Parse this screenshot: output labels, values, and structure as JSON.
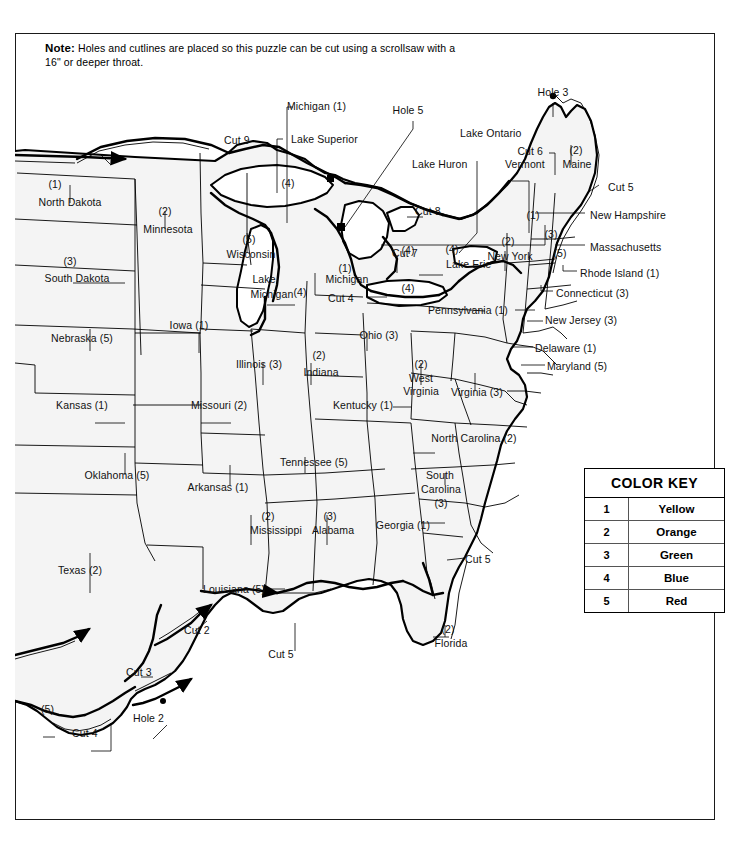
{
  "note": {
    "bold": "Note:",
    "text": " Holes and cutlines are placed so this puzzle can be cut using a scrollsaw with a 16\" or deeper throat."
  },
  "color_key": {
    "title": "COLOR KEY",
    "rows": [
      {
        "number": "1",
        "color": "Yellow"
      },
      {
        "number": "2",
        "color": "Orange"
      },
      {
        "number": "3",
        "color": "Green"
      },
      {
        "number": "4",
        "color": "Blue"
      },
      {
        "number": "5",
        "color": "Red"
      }
    ]
  },
  "states": [
    {
      "name": "North Dakota",
      "number": "(1)"
    },
    {
      "name": "Minnesota",
      "number": "(2)"
    },
    {
      "name": "South Dakota",
      "number": "(3)"
    },
    {
      "name": "Wisconsin",
      "number": "(5)"
    },
    {
      "name": "Iowa",
      "number": "(1)"
    },
    {
      "name": "Nebraska",
      "number": "(5)"
    },
    {
      "name": "Kansas",
      "number": "(1)"
    },
    {
      "name": "Missouri",
      "number": "(2)"
    },
    {
      "name": "Illinois",
      "number": "(3)"
    },
    {
      "name": "Indiana",
      "number": "(2)"
    },
    {
      "name": "Michigan",
      "number": "(1)"
    },
    {
      "name": "Michigan",
      "number": "(4)"
    },
    {
      "name": "Ohio",
      "number": "(3)"
    },
    {
      "name": "Oklahoma",
      "number": "(5)"
    },
    {
      "name": "Arkansas",
      "number": "(1)"
    },
    {
      "name": "Texas",
      "number": "(2)"
    },
    {
      "name": "Louisiana",
      "number": "(5)"
    },
    {
      "name": "Mississippi",
      "number": "(2)"
    },
    {
      "name": "Alabama",
      "number": "(3)"
    },
    {
      "name": "Tennessee",
      "number": "(5)"
    },
    {
      "name": "Kentucky",
      "number": "(1)"
    },
    {
      "name": "West Virginia",
      "number": "(2)"
    },
    {
      "name": "Virginia",
      "number": "(3)"
    },
    {
      "name": "North Carolina",
      "number": "(2)"
    },
    {
      "name": "South Carolina",
      "number": "(3)"
    },
    {
      "name": "Georgia",
      "number": "(1)"
    },
    {
      "name": "Florida",
      "number": "(2)"
    },
    {
      "name": "Pennsylvania",
      "number": "(1)"
    },
    {
      "name": "New York",
      "number": "(2)"
    },
    {
      "name": "Vermont",
      "number": "(3)"
    },
    {
      "name": "Maine",
      "number": "(2)"
    },
    {
      "name": "New Hampshire",
      "number": "(1)"
    },
    {
      "name": "Massachusetts",
      "number": "(5)"
    },
    {
      "name": "Rhode Island",
      "number": "(1)"
    },
    {
      "name": "Connecticut",
      "number": "(3)"
    },
    {
      "name": "New Jersey",
      "number": "(3)"
    },
    {
      "name": "Delaware",
      "number": "(1)"
    },
    {
      "name": "Maryland",
      "number": "(5)"
    }
  ],
  "lakes": [
    {
      "name": "Lake Superior"
    },
    {
      "name": "Lake Huron"
    },
    {
      "name": "Lake Michigan",
      "number": "(4)"
    },
    {
      "name": "Lake Erie"
    },
    {
      "name": "Lake Ontario"
    }
  ],
  "cuts": [
    {
      "label": "Cut 2"
    },
    {
      "label": "Cut 3"
    },
    {
      "label": "Cut 4"
    },
    {
      "label": "Cut 5"
    },
    {
      "label": "Cut 6"
    },
    {
      "label": "Cut 7"
    },
    {
      "label": "Cut 8"
    },
    {
      "label": "Cut 9"
    }
  ],
  "holes": [
    {
      "label": "Hole 2"
    },
    {
      "label": "Hole 3"
    },
    {
      "label": "Hole 5"
    }
  ],
  "map_labels": {
    "north_dakota_num": "(1)",
    "north_dakota": "North Dakota",
    "minnesota_num": "(2)",
    "minnesota": "Minnesota",
    "south_dakota": "(3)",
    "south_dakota_name": "South Dakota",
    "nebraska": "Nebraska (5)",
    "kansas": "Kansas (1)",
    "oklahoma": "Oklahoma (5)",
    "texas_name": "Texas  (2)",
    "iowa": "Iowa  (1)",
    "missouri": "Missouri (2)",
    "arkansas": "Arkansas (1)",
    "louisiana": "Louisiana (5)",
    "illinois": "Illinois  (3)",
    "indiana_num": "(2)",
    "indiana": "Indiana",
    "wisconsin_num": "(5)",
    "wisconsin": "Wisconsin",
    "michigan_up_num": "(4)",
    "michigan_top": "Michigan  (1)",
    "michigan_num": "(1)",
    "michigan": "Michigan",
    "michigan_lp_num": "(4)",
    "lake_michigan_1": "Lake",
    "lake_michigan_2": "Michigan",
    "lake_michigan_num": "(4)",
    "lake_superior": "Lake Superior",
    "lake_huron": "Lake Huron",
    "lake_erie": "Lake Erie",
    "lake_ontario": "Lake Ontario",
    "ohio": "Ohio (3)",
    "kentucky": "Kentucky (1)",
    "tennessee": "Tennessee (5)",
    "mississippi_num": "(2)",
    "mississippi": "Mississippi",
    "alabama_num": "(3)",
    "alabama": "Alabama",
    "georgia": "Georgia  (1)",
    "florida_num": "(2)",
    "florida": "Florida",
    "south_carolina_1": "South",
    "south_carolina_2": "Carolina",
    "south_carolina_num": "(3)",
    "north_carolina": "North Carolina (2)",
    "west_virginia_num": "(2)",
    "west_virginia_1": "West",
    "west_virginia_2": "Virginia",
    "virginia": "Virginia (3)",
    "pennsylvania": "Pennsylvania (1)",
    "pa_erie_num": "(4)",
    "ny_erie_num": "(4)",
    "ny_lake_num": "(4)",
    "new_york_num": "(2)",
    "new_york": "New York",
    "vermont": "Vermont",
    "vermont_num": "(3)",
    "maine_num": "(2)",
    "maine": "Maine",
    "new_hampshire": "New Hampshire",
    "new_hampshire_num": "(1)",
    "massachusetts": "Massachusetts",
    "massachusetts_num": "(5)",
    "rhode_island": "Rhode Island  (1)",
    "connecticut": "Connecticut (3)",
    "new_jersey": "New Jersey  (3)",
    "delaware": "Delaware  (1)",
    "maryland": "Maryland (5)",
    "ny_nh_num": "(1)",
    "cut2": "Cut 2",
    "cut3": "Cut 3",
    "cut4_sw": "Cut 4",
    "cut4_mi": "Cut 4",
    "cut5_ne": "Cut 5",
    "cut5_fl": "Cut 5",
    "cut5_la": "Cut 5",
    "cut5_ga": "Cut 5",
    "cut6": "Cut 6",
    "cut7": "Cut 7",
    "cut8": "Cut 8",
    "cut9": "Cut 9",
    "hole2": "Hole 2",
    "hole3": "Hole 3",
    "hole5": "Hole 5",
    "corner_num": "(5)"
  }
}
